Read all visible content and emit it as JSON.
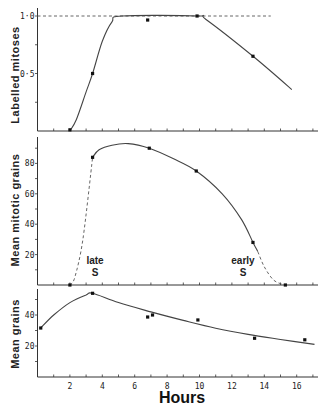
{
  "chart_data": [
    {
      "type": "line",
      "panel": "top",
      "title": "",
      "xlabel": "Hours",
      "ylabel": "Labelled mitoses",
      "xlim": [
        0,
        17.3
      ],
      "ylim": [
        0,
        1.0
      ],
      "ytick_labels": [
        "0·5",
        "1·0"
      ],
      "yticks": [
        0.5,
        1.0
      ],
      "reference_line": {
        "y": 1.0,
        "style": "dashed",
        "x_range": [
          0,
          14.4
        ]
      },
      "points": [
        {
          "x": 2.0,
          "y": 0.01
        },
        {
          "x": 3.4,
          "y": 0.5
        },
        {
          "x": 6.8,
          "y": 0.965
        },
        {
          "x": 9.85,
          "y": 1.0
        },
        {
          "x": 13.3,
          "y": 0.65
        }
      ],
      "curve": [
        [
          2.0,
          0.0
        ],
        [
          2.4,
          0.1
        ],
        [
          3.0,
          0.34
        ],
        [
          3.4,
          0.5
        ],
        [
          4.0,
          0.78
        ],
        [
          4.6,
          0.95
        ],
        [
          5.2,
          1.0
        ],
        [
          9.85,
          1.0
        ],
        [
          10.4,
          0.97
        ],
        [
          13.3,
          0.65
        ],
        [
          15.7,
          0.36
        ]
      ]
    },
    {
      "type": "line",
      "panel": "middle",
      "xlabel": "Hours",
      "ylabel": "Mean mitotic grains",
      "xlim": [
        0,
        17.3
      ],
      "ylim": [
        0,
        95
      ],
      "ytick_labels": [
        "20",
        "40",
        "60",
        "80"
      ],
      "yticks": [
        20,
        40,
        60,
        80
      ],
      "points": [
        {
          "x": 2.0,
          "y": 0
        },
        {
          "x": 3.4,
          "y": 84
        },
        {
          "x": 6.9,
          "y": 90
        },
        {
          "x": 9.8,
          "y": 75
        },
        {
          "x": 13.3,
          "y": 28
        },
        {
          "x": 15.3,
          "y": 0
        }
      ],
      "curve_dashed_rise": [
        [
          2.0,
          0
        ],
        [
          2.3,
          5
        ],
        [
          2.8,
          30
        ],
        [
          3.4,
          84
        ]
      ],
      "curve_solid": [
        [
          3.4,
          84
        ],
        [
          3.8,
          89
        ],
        [
          4.6,
          92
        ],
        [
          5.6,
          93
        ],
        [
          6.9,
          90
        ],
        [
          8.4,
          83
        ],
        [
          9.8,
          75
        ],
        [
          11.4,
          60
        ],
        [
          12.6,
          43
        ],
        [
          13.3,
          28
        ],
        [
          13.6,
          22
        ]
      ],
      "curve_dashed_fall": [
        [
          13.6,
          22
        ],
        [
          14.0,
          12
        ],
        [
          14.6,
          3
        ],
        [
          15.3,
          0
        ]
      ],
      "annotations": [
        {
          "text_line1": "late",
          "text_line2": "S",
          "x": 3.6,
          "y": 12
        },
        {
          "text_line1": "early",
          "text_line2": "S",
          "x": 12.8,
          "y": 12
        }
      ]
    },
    {
      "type": "line",
      "panel": "bottom",
      "xlabel": "Hours",
      "ylabel": "Mean grains",
      "xlim": [
        0,
        17.3
      ],
      "ylim": [
        0,
        56
      ],
      "ytick_labels": [
        "20",
        "40"
      ],
      "yticks": [
        20,
        40
      ],
      "xtick_labels": [
        "2",
        "4",
        "6",
        "8",
        "10",
        "12",
        "14",
        "16"
      ],
      "xticks": [
        2,
        4,
        6,
        8,
        10,
        12,
        14,
        16
      ],
      "points": [
        {
          "x": 0.2,
          "y": 31.6
        },
        {
          "x": 3.4,
          "y": 54
        },
        {
          "x": 6.8,
          "y": 38.7
        },
        {
          "x": 7.1,
          "y": 40
        },
        {
          "x": 9.9,
          "y": 36.8
        },
        {
          "x": 13.4,
          "y": 25
        },
        {
          "x": 16.5,
          "y": 24
        }
      ],
      "curve": [
        [
          0.2,
          31.6
        ],
        [
          1.0,
          40
        ],
        [
          2.0,
          48
        ],
        [
          3.0,
          53
        ],
        [
          3.4,
          54
        ],
        [
          5.0,
          48
        ],
        [
          7.0,
          42
        ],
        [
          9.0,
          36.5
        ],
        [
          11.0,
          31.5
        ],
        [
          13.0,
          27.5
        ],
        [
          15.0,
          24.2
        ],
        [
          17.1,
          21
        ]
      ]
    }
  ],
  "labels": {
    "top_ylabel": "Labelled mitoses",
    "middle_ylabel": "Mean mitotic grains",
    "bottom_ylabel": "Mean grains",
    "xlabel": "Hours",
    "late_line1": "late",
    "late_line2": "S",
    "early_line1": "early",
    "early_line2": "S"
  }
}
